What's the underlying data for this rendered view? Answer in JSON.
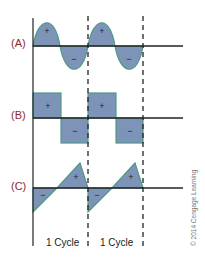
{
  "colors": {
    "fill": "#7d93b8",
    "stroke": "#4f9a86",
    "axis": "#222222",
    "label": "#8b2a2a"
  },
  "waveforms": [
    {
      "id": "A",
      "label": "(A)",
      "type": "sine",
      "pos_sign": "+",
      "neg_sign": "−"
    },
    {
      "id": "B",
      "label": "(B)",
      "type": "square",
      "pos_sign": "+",
      "neg_sign": "−"
    },
    {
      "id": "C",
      "label": "(C)",
      "type": "sawtooth",
      "pos_sign": "+",
      "neg_sign": "−"
    }
  ],
  "cycle_labels": [
    "1 Cycle",
    "1 Cycle"
  ],
  "copyright": "© 2014 Cengage Learning"
}
